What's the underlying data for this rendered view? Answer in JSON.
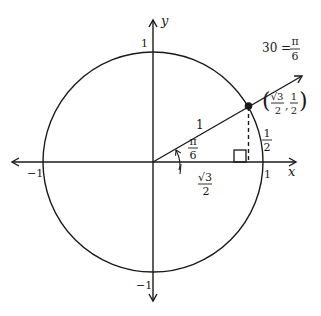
{
  "diagram": {
    "axes": {
      "x_label": "x",
      "y_label": "y",
      "x_pos_tick": "1",
      "x_neg_tick": "−1",
      "y_pos_tick": "1",
      "y_neg_tick": "−1"
    },
    "ray_label": {
      "lhs": "30 =",
      "num": "π",
      "den": "6"
    },
    "hypotenuse_label": "1",
    "angle_label": {
      "num": "π",
      "den": "6"
    },
    "adjacent_label": {
      "num": "√3",
      "den": "2"
    },
    "opposite_label": {
      "num": "1",
      "den": "2"
    },
    "point_label": {
      "open": "(",
      "x_num": "√3",
      "x_den": "2",
      "sep": ",",
      "y_num": "1",
      "y_den": "2",
      "close": ")"
    },
    "colors": {
      "stroke": "#1a1a1a",
      "background": "#ffffff"
    }
  }
}
